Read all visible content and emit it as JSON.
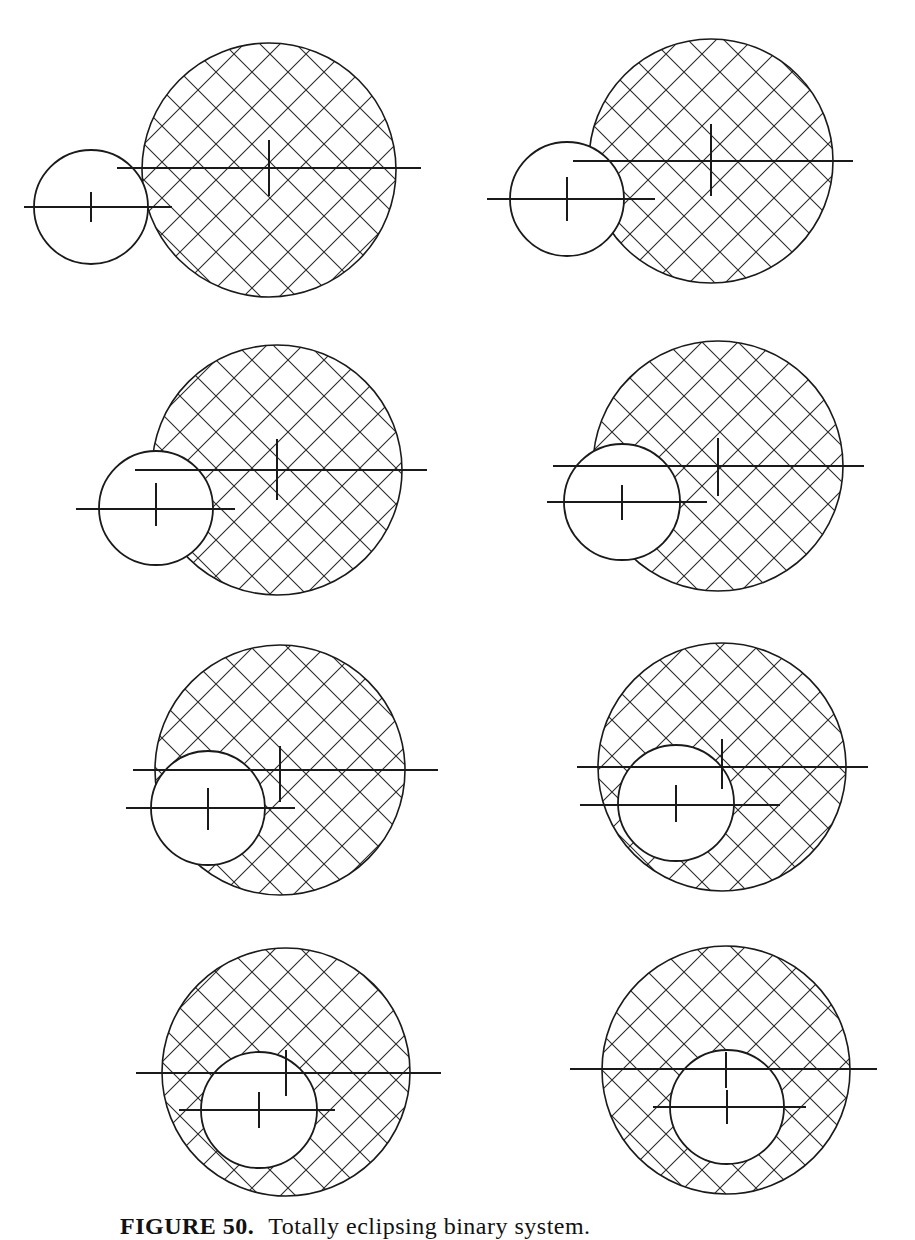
{
  "figure": {
    "colors": {
      "stroke": "#1a1a1a",
      "hatch": "#2a2a2a",
      "background": "#ffffff"
    },
    "hatch_spacing": 36,
    "panels": [
      {
        "id": 1,
        "big": {
          "cx": 269,
          "cy": 170,
          "r": 127
        },
        "small": {
          "cx": 91,
          "cy": 207,
          "r": 57
        },
        "big_line": {
          "x1": 117,
          "x2": 421,
          "y": 168
        },
        "big_tick": {
          "y1": 140,
          "y2": 196
        },
        "small_line": {
          "x1": 24,
          "x2": 172,
          "y": 207
        },
        "small_tick": {
          "y1": 192,
          "y2": 222
        }
      },
      {
        "id": 2,
        "big": {
          "cx": 711,
          "cy": 161,
          "r": 122
        },
        "small": {
          "cx": 567,
          "cy": 199,
          "r": 57
        },
        "big_line": {
          "x1": 573,
          "x2": 853,
          "y": 161
        },
        "big_tick": {
          "y1": 124,
          "y2": 196
        },
        "small_line": {
          "x1": 487,
          "x2": 655,
          "y": 199
        },
        "small_tick": {
          "y1": 177,
          "y2": 221
        }
      },
      {
        "id": 3,
        "big": {
          "cx": 277,
          "cy": 470,
          "r": 125
        },
        "small": {
          "cx": 156,
          "cy": 508,
          "r": 57
        },
        "big_line": {
          "x1": 135,
          "x2": 427,
          "y": 470
        },
        "big_tick": {
          "y1": 439,
          "y2": 500
        },
        "small_line": {
          "x1": 76,
          "x2": 235,
          "y": 509
        },
        "small_tick": {
          "y1": 483,
          "y2": 526
        }
      },
      {
        "id": 4,
        "big": {
          "cx": 718,
          "cy": 466,
          "r": 125
        },
        "small": {
          "cx": 622,
          "cy": 502,
          "r": 58
        },
        "big_line": {
          "x1": 553,
          "x2": 864,
          "y": 466
        },
        "big_tick": {
          "y1": 438,
          "y2": 496
        },
        "small_line": {
          "x1": 547,
          "x2": 707,
          "y": 502
        },
        "small_tick": {
          "y1": 485,
          "y2": 520
        }
      },
      {
        "id": 5,
        "big": {
          "cx": 280,
          "cy": 770,
          "r": 125
        },
        "small": {
          "cx": 208,
          "cy": 808,
          "r": 57
        },
        "big_line": {
          "x1": 133,
          "x2": 438,
          "y": 770
        },
        "big_tick": {
          "y1": 746,
          "y2": 802
        },
        "small_line": {
          "x1": 126,
          "x2": 295,
          "y": 808
        },
        "small_tick": {
          "y1": 788,
          "y2": 830
        }
      },
      {
        "id": 6,
        "big": {
          "cx": 722,
          "cy": 767,
          "r": 124
        },
        "small": {
          "cx": 676,
          "cy": 803,
          "r": 58
        },
        "big_line": {
          "x1": 577,
          "x2": 868,
          "y": 767
        },
        "big_tick": {
          "y1": 739,
          "y2": 789
        },
        "small_line": {
          "x1": 580,
          "x2": 780,
          "y": 805
        },
        "small_tick": {
          "y1": 785,
          "y2": 822
        }
      },
      {
        "id": 7,
        "big": {
          "cx": 286,
          "cy": 1072,
          "r": 124
        },
        "small": {
          "cx": 259,
          "cy": 1110,
          "r": 58
        },
        "big_line": {
          "x1": 136,
          "x2": 441,
          "y": 1073
        },
        "big_tick": {
          "y1": 1050,
          "y2": 1096
        },
        "small_line": {
          "x1": 179,
          "x2": 335,
          "y": 1110
        },
        "small_tick": {
          "y1": 1092,
          "y2": 1128
        }
      },
      {
        "id": 8,
        "big": {
          "cx": 726,
          "cy": 1070,
          "r": 124
        },
        "small": {
          "cx": 727,
          "cy": 1107,
          "r": 57
        },
        "big_line": {
          "x1": 570,
          "x2": 877,
          "y": 1069
        },
        "big_tick": {
          "y1": 1052,
          "y2": 1088
        },
        "small_line": {
          "x1": 653,
          "x2": 806,
          "y": 1107
        },
        "small_tick": {
          "y1": 1090,
          "y2": 1124
        }
      }
    ]
  },
  "caption": {
    "label": "FIGURE 50.",
    "text": "Totally eclipsing binary system."
  }
}
